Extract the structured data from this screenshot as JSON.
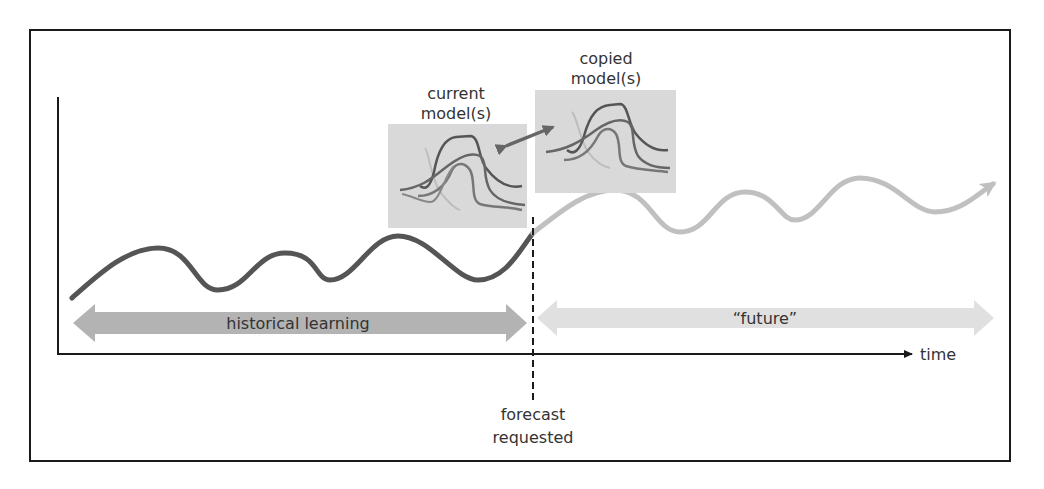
{
  "diagram": {
    "labels": {
      "current_model_line1": "current",
      "current_model_line2": "model(s)",
      "copied_model_line1": "copied",
      "copied_model_line2": "model(s)",
      "historical": "historical learning",
      "future": "“future”",
      "time": "time",
      "forecast_line1": "forecast",
      "forecast_line2": "requested"
    },
    "colors": {
      "frame": "#1a1a1a",
      "history_curve": "#555555",
      "future_curve": "#c0c0c0",
      "history_arrow": "#b3b3b3",
      "future_arrow": "#e0e0e0",
      "model_box": "#d9d9d9",
      "swap_arrow": "#666666"
    },
    "nodes": [
      {
        "id": "current-models",
        "label": "current model(s)"
      },
      {
        "id": "copied-models",
        "label": "copied model(s)"
      }
    ],
    "edges": [
      {
        "from": "current-models",
        "to": "copied-models",
        "type": "bidirectional"
      }
    ],
    "timeline": {
      "segments": [
        "historical learning",
        "“future”"
      ],
      "marker": "forecast requested",
      "axis_label": "time"
    }
  }
}
